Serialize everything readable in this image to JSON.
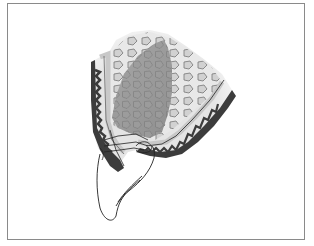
{
  "figure": {
    "type": "anatomical-illustration",
    "colors": {
      "frame": "#8a8a8a",
      "background": "#ffffff",
      "cortical_bone": "#3c3c3c",
      "periosteum_light": "#d8d8d8",
      "cancellous_fill": "#e6e6e6",
      "trabecula_outline": "#6e6e6e",
      "sinus_core": "#9a9a9a",
      "tooth_outline": "#222222"
    },
    "parts": [
      "outer-frame",
      "cancellous-bone",
      "sinus-region",
      "cortical-bone-left",
      "cortical-bone-right",
      "crestal-lines",
      "tooth-outline"
    ]
  }
}
